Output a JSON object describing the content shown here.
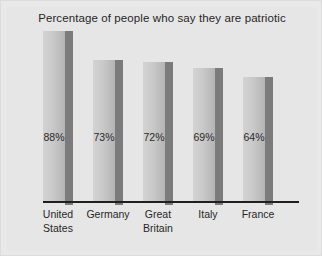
{
  "chart_data": {
    "type": "bar",
    "title": "Percentage of people who say they are patriotic",
    "xlabel": "",
    "ylabel": "",
    "ylim": [
      0,
      100
    ],
    "grid": false,
    "legend": "none",
    "categories": [
      "United States",
      "Germany",
      "Great Britain",
      "Italy",
      "France"
    ],
    "category_lines": [
      [
        "United",
        "States"
      ],
      [
        "Germany"
      ],
      [
        "Great",
        "Britain"
      ],
      [
        "Italy"
      ],
      [
        "France"
      ]
    ],
    "values": [
      88,
      73,
      72,
      69,
      64
    ],
    "value_labels": [
      "88%",
      "73%",
      "72%",
      "69%",
      "64%"
    ],
    "colors": {
      "background": "#e6e6e6",
      "frame": "#dcdcdc",
      "bar_light": "#d3d3d3",
      "bar_dark": "#b4b4b4",
      "bar_shadow": "#7b7b7b",
      "axis": "#1f1f1f",
      "text": "#262626"
    }
  }
}
